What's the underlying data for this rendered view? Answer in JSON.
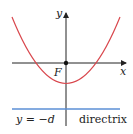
{
  "diagram": {
    "type": "parabola",
    "labels": {
      "y_axis": "y",
      "x_axis": "x",
      "focus": "F",
      "directrix_eq": "y = −d",
      "directrix": "directrix"
    },
    "colors": {
      "parabola": "#d9474d",
      "directrix": "#5b8fd6",
      "axes": "#222222"
    }
  }
}
